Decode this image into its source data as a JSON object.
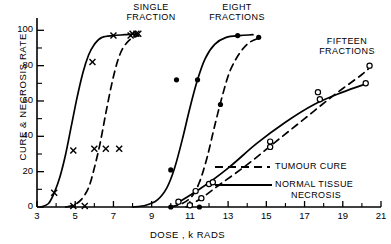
{
  "figure": {
    "title": "",
    "xlabel": "DOSE , k RADS",
    "ylabel": "CURE & NECROSIS RATE"
  },
  "annotations": {
    "single": "SINGLE\nFRACTION",
    "eight": "EIGHT\nFRACTIONS",
    "fifteen": "FIFTEEN\nFRACTIONS"
  },
  "legend": {
    "items": [
      {
        "label": "TUMOUR CURE",
        "style": "dashed"
      },
      {
        "label": "NORMAL TISSUE\nNECROSIS",
        "style": "solid"
      }
    ],
    "dash_label": "TUMOUR CURE",
    "solid_label_line1": "NORMAL TISSUE",
    "solid_label_line2": "NECROSIS"
  },
  "axes": {
    "x_ticks": [
      "3",
      "5",
      "7",
      "9",
      "11",
      "13",
      "15",
      "17",
      "19",
      "21"
    ],
    "x_tick_values": [
      3,
      5,
      7,
      9,
      11,
      13,
      15,
      17,
      19,
      21
    ],
    "x_minor_values": [
      4,
      6,
      8,
      10,
      12,
      14,
      16,
      18,
      20
    ],
    "y_ticks": [
      "0",
      "20",
      "40",
      "60",
      "80",
      "100"
    ],
    "y_tick_values": [
      0,
      20,
      40,
      60,
      80,
      100
    ],
    "y_minor_values": [
      10,
      30,
      50,
      70,
      90
    ],
    "xlim": [
      3,
      21
    ],
    "ylim": [
      0,
      103
    ]
  },
  "chart_data": {
    "type": "line",
    "title": "",
    "xlabel": "DOSE , k RADS",
    "ylabel": "CURE & NECROSIS RATE",
    "xlim": [
      3,
      21
    ],
    "ylim": [
      0,
      103
    ],
    "grid": false,
    "legend_position": "lower right",
    "series": [
      {
        "name": "SINGLE FRACTION - NORMAL TISSUE NECROSIS",
        "style": "solid",
        "marker": "x",
        "group": "single",
        "points": [
          [
            3.2,
            0
          ],
          [
            3.6,
            2
          ],
          [
            3.9,
            8
          ],
          [
            4.2,
            17
          ],
          [
            4.5,
            30
          ],
          [
            4.8,
            46
          ],
          [
            5.1,
            62
          ],
          [
            5.4,
            76
          ],
          [
            5.7,
            86
          ],
          [
            6.0,
            92
          ],
          [
            6.4,
            96
          ],
          [
            7.0,
            97
          ],
          [
            7.6,
            97.5
          ],
          [
            8.2,
            98
          ]
        ],
        "data_markers": [
          [
            3.9,
            8
          ],
          [
            4.9,
            32
          ],
          [
            5.9,
            82
          ],
          [
            7.0,
            97
          ],
          [
            8.0,
            98
          ],
          [
            8.3,
            98
          ]
        ]
      },
      {
        "name": "SINGLE FRACTION - TUMOUR CURE",
        "style": "dashed",
        "marker": "x",
        "group": "single",
        "points": [
          [
            4.5,
            0
          ],
          [
            4.9,
            1
          ],
          [
            5.3,
            4
          ],
          [
            5.7,
            11
          ],
          [
            6.0,
            22
          ],
          [
            6.3,
            36
          ],
          [
            6.6,
            53
          ],
          [
            6.9,
            69
          ],
          [
            7.2,
            82
          ],
          [
            7.5,
            90
          ],
          [
            7.9,
            95
          ],
          [
            8.3,
            97
          ]
        ],
        "data_markers": [
          [
            4.9,
            0.5
          ],
          [
            5.5,
            0.5
          ],
          [
            6.0,
            33
          ],
          [
            6.6,
            33
          ],
          [
            7.3,
            33
          ],
          [
            7.9,
            97
          ],
          [
            8.2,
            98
          ]
        ]
      },
      {
        "name": "EIGHT FRACTIONS - NORMAL TISSUE NECROSIS",
        "style": "solid",
        "marker": "filled-circle",
        "group": "eight",
        "points": [
          [
            8.0,
            0
          ],
          [
            8.7,
            1
          ],
          [
            9.3,
            4
          ],
          [
            9.8,
            11
          ],
          [
            10.2,
            22
          ],
          [
            10.6,
            38
          ],
          [
            11.0,
            56
          ],
          [
            11.4,
            72
          ],
          [
            11.8,
            84
          ],
          [
            12.3,
            92
          ],
          [
            12.9,
            96
          ],
          [
            13.6,
            97
          ],
          [
            14.3,
            97.5
          ]
        ],
        "data_markers": [
          [
            10.0,
            21
          ],
          [
            10.3,
            72
          ],
          [
            11.4,
            72
          ],
          [
            13.5,
            97
          ]
        ]
      },
      {
        "name": "EIGHT FRACTIONS - TUMOUR CURE",
        "style": "dashed",
        "marker": "filled-circle",
        "group": "eight",
        "points": [
          [
            10.0,
            0
          ],
          [
            10.6,
            2
          ],
          [
            11.1,
            6
          ],
          [
            11.5,
            14
          ],
          [
            11.9,
            28
          ],
          [
            12.3,
            46
          ],
          [
            12.7,
            63
          ],
          [
            13.1,
            77
          ],
          [
            13.6,
            87
          ],
          [
            14.1,
            93
          ],
          [
            14.7,
            96
          ]
        ],
        "data_markers": [
          [
            10.0,
            0
          ],
          [
            11.5,
            0
          ],
          [
            12.6,
            58
          ],
          [
            14.6,
            96
          ]
        ]
      },
      {
        "name": "FIFTEEN FRACTIONS - NORMAL TISSUE NECROSIS",
        "style": "solid",
        "marker": "open-circle",
        "group": "fifteen",
        "points": [
          [
            10.3,
            2
          ],
          [
            11.5,
            10
          ],
          [
            13.0,
            22
          ],
          [
            14.5,
            36
          ],
          [
            16.0,
            48
          ],
          [
            17.5,
            58
          ],
          [
            19.0,
            65
          ],
          [
            20.3,
            70
          ]
        ],
        "data_markers": [
          [
            10.4,
            3
          ],
          [
            11.3,
            9
          ],
          [
            12.0,
            13
          ],
          [
            15.2,
            37
          ],
          [
            17.8,
            61
          ],
          [
            20.2,
            70
          ]
        ]
      },
      {
        "name": "FIFTEEN FRACTIONS - TUMOUR CURE",
        "style": "dashed",
        "marker": "open-circle",
        "group": "fifteen",
        "points": [
          [
            10.8,
            0
          ],
          [
            11.6,
            5
          ],
          [
            12.6,
            13
          ],
          [
            14.0,
            24
          ],
          [
            15.5,
            37
          ],
          [
            17.0,
            50
          ],
          [
            18.5,
            63
          ],
          [
            20.0,
            75
          ],
          [
            20.5,
            80
          ]
        ],
        "data_markers": [
          [
            11.0,
            1
          ],
          [
            11.6,
            5
          ],
          [
            12.2,
            14
          ],
          [
            15.2,
            34
          ],
          [
            17.7,
            65
          ],
          [
            20.4,
            80
          ]
        ]
      }
    ]
  }
}
